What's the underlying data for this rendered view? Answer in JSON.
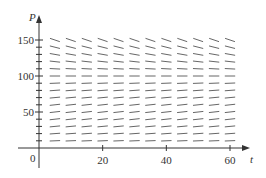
{
  "chart_data": {
    "type": "slope_field",
    "title": "",
    "xlabel": "t",
    "ylabel": "P",
    "xlim": [
      0,
      60
    ],
    "ylim": [
      0,
      150
    ],
    "x_ticks": [
      20,
      40,
      60
    ],
    "x_tick_labels": [
      "20",
      "40",
      "60"
    ],
    "y_ticks": [
      50,
      100,
      150
    ],
    "y_tick_labels": [
      "50",
      "100",
      "150"
    ],
    "y_minor_ticks": [
      10,
      20,
      30,
      40,
      60,
      70,
      80,
      90,
      110,
      120,
      130,
      140
    ],
    "origin_label": "0",
    "grid": false,
    "legend": null,
    "field": {
      "t_values": [
        5,
        10,
        15,
        20,
        25,
        30,
        35,
        40,
        45,
        50,
        55,
        60
      ],
      "P_values": [
        10,
        20,
        30,
        40,
        50,
        60,
        70,
        80,
        90,
        100,
        110,
        120,
        130,
        140,
        150
      ],
      "equilibrium_P": 100,
      "description": "Slopes are small and positive for P below ~100, approximately zero near P = 100, and increasingly negative above 100 (steepest at P = 150). Slopes are independent of t."
    }
  },
  "colors": {
    "axis": "#333333",
    "segment": "#555555",
    "background": "#ffffff"
  }
}
